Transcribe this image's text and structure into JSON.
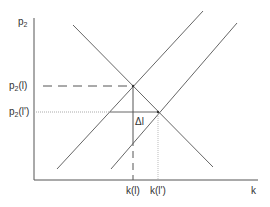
{
  "diagram": {
    "type": "supply-demand",
    "y_axis_label_base": "p",
    "y_axis_label_sub": "2",
    "x_axis_label": "k",
    "y_ticks": [
      {
        "base": "p",
        "sub": "2",
        "arg": "(l)"
      },
      {
        "base": "p",
        "sub": "2",
        "arg": "(l')"
      }
    ],
    "x_ticks": [
      "k(l)",
      "k(l')"
    ],
    "annotation": "Δl",
    "colors": {
      "line": "#666666",
      "axis": "#555555",
      "text": "#333333"
    }
  }
}
